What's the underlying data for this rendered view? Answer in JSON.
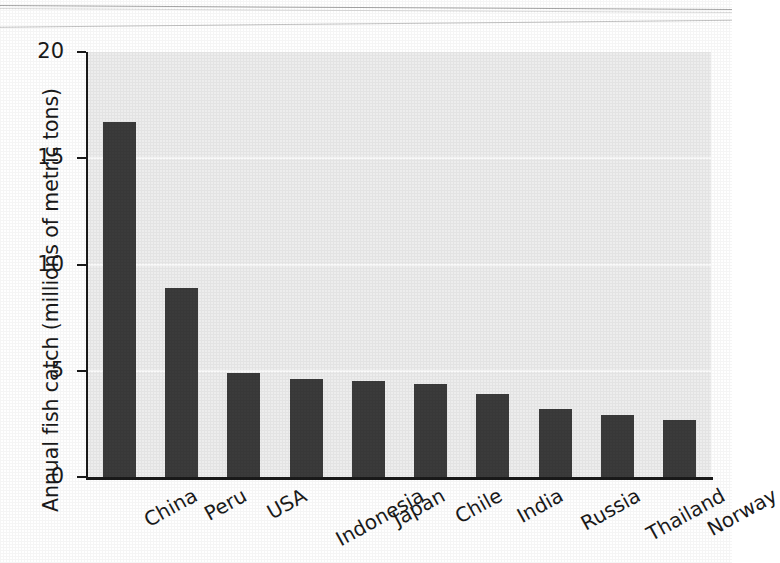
{
  "chart_data": {
    "type": "bar",
    "title": "",
    "xlabel": "",
    "ylabel": "Annual fish catch (millions of metric tons)",
    "categories": [
      "China",
      "Peru",
      "USA",
      "Indonesia",
      "Japan",
      "Chile",
      "India",
      "Russia",
      "Thailand",
      "Norway"
    ],
    "values": [
      16.7,
      8.9,
      4.9,
      4.6,
      4.5,
      4.4,
      3.9,
      3.2,
      2.9,
      2.7
    ],
    "ylim": [
      0,
      20
    ],
    "ytick_labels": [
      "0",
      "5",
      "10",
      "15",
      "20"
    ],
    "ytick_values": [
      0,
      5,
      10,
      15,
      20
    ],
    "grid": "horizontal",
    "gridline_values": [
      5,
      10,
      15
    ],
    "legend": "none",
    "bar_color": "#3b3b3b",
    "plot_background_color": "#ededed",
    "gridline_color": "#fbfbfb",
    "axis_color": "#1a1a1a",
    "xtick_label_rotation_deg": -29
  },
  "figure": {
    "page_artifacts": [
      "scan-line-top-1",
      "scan-line-top-2",
      "scan-line-top-3"
    ]
  }
}
